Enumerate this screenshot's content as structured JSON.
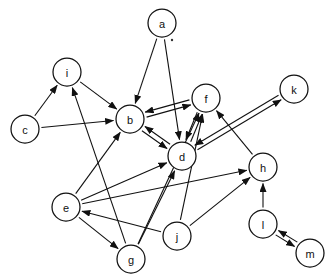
{
  "diagram": {
    "type": "directed-graph",
    "canvas": {
      "width": 332,
      "height": 280,
      "background": "#ffffff"
    },
    "style": {
      "node_fill": "#ffffff",
      "node_stroke": "#111111",
      "edge_color": "#111111",
      "node_radius": 14,
      "label_size": 11
    },
    "nodes": [
      {
        "id": "a",
        "label": "a",
        "x": 162,
        "y": 23,
        "r": 14
      },
      {
        "id": "i",
        "label": "i",
        "x": 67,
        "y": 72,
        "r": 14
      },
      {
        "id": "f",
        "label": "f",
        "x": 206,
        "y": 98,
        "r": 14
      },
      {
        "id": "k",
        "label": "k",
        "x": 294,
        "y": 89,
        "r": 14
      },
      {
        "id": "c",
        "label": "c",
        "x": 25,
        "y": 129,
        "r": 14
      },
      {
        "id": "b",
        "label": "b",
        "x": 130,
        "y": 119,
        "r": 14
      },
      {
        "id": "d",
        "label": "d",
        "x": 182,
        "y": 156,
        "r": 14
      },
      {
        "id": "h",
        "label": "h",
        "x": 263,
        "y": 167,
        "r": 14
      },
      {
        "id": "e",
        "label": "e",
        "x": 66,
        "y": 207,
        "r": 14
      },
      {
        "id": "j",
        "label": "j",
        "x": 177,
        "y": 236,
        "r": 14
      },
      {
        "id": "l",
        "label": "l",
        "x": 263,
        "y": 224,
        "r": 14
      },
      {
        "id": "g",
        "label": "g",
        "x": 131,
        "y": 259,
        "r": 14
      },
      {
        "id": "m",
        "label": "m",
        "x": 310,
        "y": 253,
        "r": 14
      }
    ],
    "edges": [
      {
        "from": "a",
        "to": "b",
        "bidirectional": false,
        "offset": 0
      },
      {
        "from": "a",
        "to": "d",
        "bidirectional": false,
        "offset": 0
      },
      {
        "from": "c",
        "to": "i",
        "bidirectional": false,
        "offset": 0
      },
      {
        "from": "c",
        "to": "b",
        "bidirectional": false,
        "offset": 0
      },
      {
        "from": "i",
        "to": "b",
        "bidirectional": false,
        "offset": 0
      },
      {
        "from": "g",
        "to": "i",
        "bidirectional": false,
        "offset": 0
      },
      {
        "from": "b",
        "to": "f",
        "bidirectional": true,
        "offset": 2.6
      },
      {
        "from": "b",
        "to": "d",
        "bidirectional": true,
        "offset": 2.6
      },
      {
        "from": "d",
        "to": "f",
        "bidirectional": true,
        "offset": 2.6
      },
      {
        "from": "d",
        "to": "k",
        "bidirectional": true,
        "offset": 2.6
      },
      {
        "from": "e",
        "to": "b",
        "bidirectional": false,
        "offset": 0
      },
      {
        "from": "e",
        "to": "d",
        "bidirectional": false,
        "offset": 0
      },
      {
        "from": "e",
        "to": "h",
        "bidirectional": false,
        "offset": 0
      },
      {
        "from": "e",
        "to": "g",
        "bidirectional": false,
        "offset": 0
      },
      {
        "from": "g",
        "to": "d",
        "bidirectional": false,
        "offset": 0
      },
      {
        "from": "g",
        "to": "f",
        "bidirectional": false,
        "offset": 0
      },
      {
        "from": "j",
        "to": "e",
        "bidirectional": false,
        "offset": 0
      },
      {
        "from": "j",
        "to": "f",
        "bidirectional": false,
        "offset": 0
      },
      {
        "from": "j",
        "to": "h",
        "bidirectional": false,
        "offset": 0
      },
      {
        "from": "h",
        "to": "f",
        "bidirectional": false,
        "offset": 0
      },
      {
        "from": "l",
        "to": "h",
        "bidirectional": false,
        "offset": 0
      },
      {
        "from": "l",
        "to": "m",
        "bidirectional": true,
        "offset": 2.6
      }
    ],
    "specks": [
      {
        "x": 172,
        "y": 40,
        "r": 1.2
      }
    ]
  }
}
